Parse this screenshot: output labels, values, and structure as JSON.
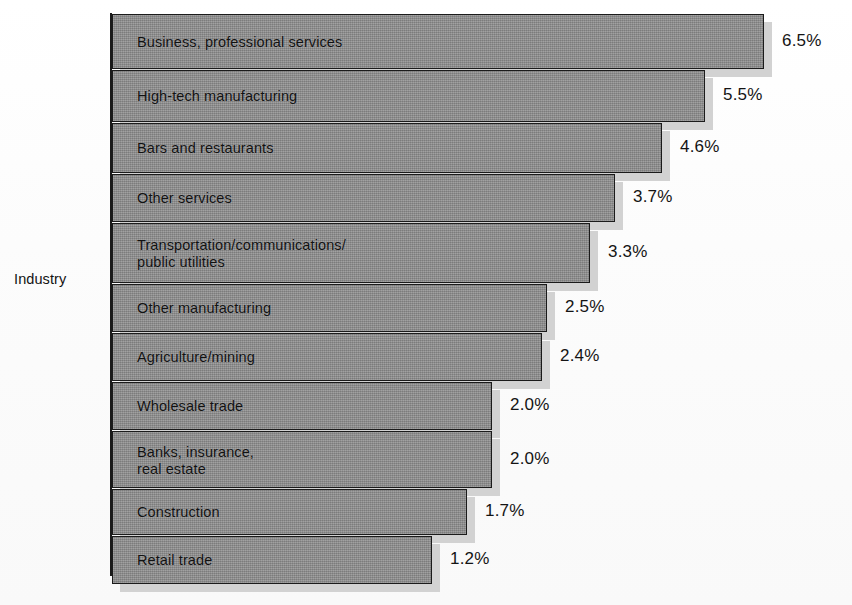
{
  "axis": {
    "y_label": "Industry"
  },
  "title_fragment": "",
  "chart_data": {
    "type": "bar",
    "orientation": "horizontal",
    "title": "",
    "xlabel": "",
    "ylabel": "Industry",
    "unit": "%",
    "grid": false,
    "legend": null,
    "xlim": [
      0,
      6.5
    ],
    "categories": [
      "Business, professional services",
      "High-tech manufacturing",
      "Bars and restaurants",
      "Other services",
      "Transportation/communications/\npublic utilities",
      "Other manufacturing",
      "Agriculture/mining",
      "Wholesale trade",
      "Banks, insurance,\nreal estate",
      "Construction",
      "Retail trade"
    ],
    "values": [
      6.5,
      5.5,
      4.6,
      3.7,
      3.3,
      2.5,
      2.4,
      2.0,
      2.0,
      1.7,
      1.2
    ],
    "value_labels": [
      "6.5%",
      "5.5%",
      "4.6%",
      "3.7%",
      "3.3%",
      "2.5%",
      "2.4%",
      "2.0%",
      "2.0%",
      "1.7%",
      "1.2%"
    ]
  },
  "bars": [
    {
      "label": "Business, professional services",
      "value_label": "6.5%",
      "top": 4,
      "height": 55,
      "width": 652,
      "value_x": 672
    },
    {
      "label": "High-tech manufacturing",
      "value_label": "5.5%",
      "top": 60,
      "height": 52,
      "width": 593,
      "value_x": 613
    },
    {
      "label": "Bars and restaurants",
      "value_label": "4.6%",
      "top": 113,
      "height": 50,
      "width": 550,
      "value_x": 570
    },
    {
      "label": "Other services",
      "value_label": "3.7%",
      "top": 164,
      "height": 48,
      "width": 503,
      "value_x": 523
    },
    {
      "label": "Transportation/communications/\npublic utilities",
      "value_label": "3.3%",
      "top": 213,
      "height": 60,
      "width": 478,
      "value_x": 498
    },
    {
      "label": "Other manufacturing",
      "value_label": "2.5%",
      "top": 274,
      "height": 48,
      "width": 435,
      "value_x": 455
    },
    {
      "label": "Agriculture/mining",
      "value_label": "2.4%",
      "top": 323,
      "height": 48,
      "width": 430,
      "value_x": 450
    },
    {
      "label": "Wholesale trade",
      "value_label": "2.0%",
      "top": 372,
      "height": 48,
      "width": 380,
      "value_x": 400
    },
    {
      "label": "Banks, insurance,\nreal estate",
      "value_label": "2.0%",
      "top": 421,
      "height": 57,
      "width": 380,
      "value_x": 400
    },
    {
      "label": "Construction",
      "value_label": "1.7%",
      "top": 479,
      "height": 46,
      "width": 355,
      "value_x": 375
    },
    {
      "label": "Retail trade",
      "value_label": "1.2%",
      "top": 526,
      "height": 48,
      "width": 320,
      "value_x": 340
    }
  ],
  "colors": {
    "bar_fill": "#8d8d8d",
    "bar_border": "#1b1b1b",
    "bar_shadow": "#d2d2d2",
    "text": "#111111",
    "background": "#fdfdfd"
  }
}
